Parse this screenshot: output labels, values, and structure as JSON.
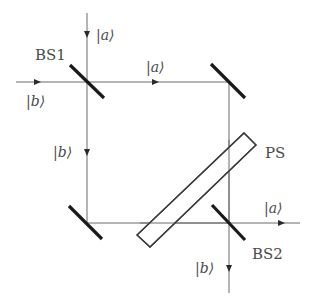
{
  "diagram": {
    "colors": {
      "beam": "#6b6b6b",
      "optic": "#1a1a1a",
      "plate": "#3a3a3a",
      "text": "#4a4a4a",
      "background": "#ffffff"
    },
    "components": [
      {
        "id": "bs1",
        "label": "BS1",
        "type": "beam-splitter"
      },
      {
        "id": "mirror-top-right",
        "label": "",
        "type": "mirror"
      },
      {
        "id": "mirror-bottom-left",
        "label": "",
        "type": "mirror"
      },
      {
        "id": "bs2",
        "label": "BS2",
        "type": "beam-splitter"
      },
      {
        "id": "ps",
        "label": "PS",
        "type": "phase-shifter"
      }
    ],
    "labels": {
      "bs1": "BS1",
      "bs2": "BS2",
      "ps": "PS",
      "input_top": "|a⟩",
      "input_left": "|b⟩",
      "upper_path": "|a⟩",
      "left_path": "|b⟩",
      "output_right": "|a⟩",
      "output_bottom": "|b⟩"
    }
  }
}
